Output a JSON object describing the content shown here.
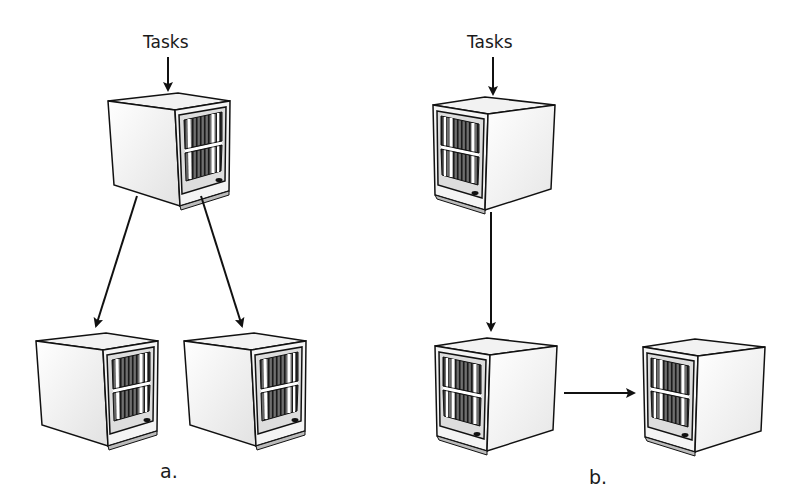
{
  "diagram": {
    "type": "task-distribution-topologies",
    "panels": [
      {
        "id": "a",
        "caption": "a.",
        "input_label": "Tasks",
        "description": "One computer receives tasks and distributes them to two computers in parallel",
        "nodes": [
          "top",
          "bottom-left",
          "bottom-right"
        ],
        "edges": [
          [
            "input",
            "top"
          ],
          [
            "top",
            "bottom-left"
          ],
          [
            "top",
            "bottom-right"
          ]
        ]
      },
      {
        "id": "b",
        "caption": "b.",
        "input_label": "Tasks",
        "description": "One computer receives tasks and passes them sequentially through a chain",
        "nodes": [
          "top",
          "bottom-left",
          "bottom-right"
        ],
        "edges": [
          [
            "input",
            "top"
          ],
          [
            "top",
            "bottom-left"
          ],
          [
            "bottom-left",
            "bottom-right"
          ]
        ]
      }
    ]
  },
  "labels": {
    "a_tasks": "Tasks",
    "b_tasks": "Tasks",
    "a_caption": "a.",
    "b_caption": "b."
  }
}
